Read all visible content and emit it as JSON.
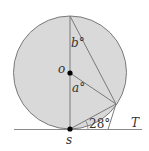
{
  "diagram": {
    "type": "circle-tangent-geometry",
    "points": {
      "center": "o",
      "tangent_point": "s",
      "tangent_line": "T"
    },
    "angles": {
      "a": "a°",
      "b": "b°",
      "given": "28°"
    },
    "colors": {
      "circle_fill": "#d9d9d9",
      "stroke": "#7a7a7a",
      "point": "#000000",
      "line": "#8a8a8a"
    }
  }
}
